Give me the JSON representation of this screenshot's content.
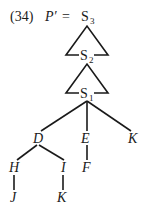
{
  "example": {
    "number": "(34)",
    "lhs": "P′",
    "equals": "="
  },
  "tree": {
    "triangles": [
      {
        "top": {
          "base": "S",
          "sub": "3"
        },
        "bottom": {
          "base": "S",
          "sub": "2"
        }
      },
      {
        "top": {
          "base": "S",
          "sub": "2"
        },
        "bottom": {
          "base": "S",
          "sub": "1"
        }
      }
    ],
    "nodes": {
      "s3": {
        "base": "S",
        "sub": "3"
      },
      "s2": {
        "base": "S",
        "sub": "2"
      },
      "s1": {
        "base": "S",
        "sub": "1"
      },
      "d": "D",
      "e": "E",
      "k1": "K",
      "h": "H",
      "i": "I",
      "f": "F",
      "j": "J",
      "k2": "K"
    },
    "edges": [
      [
        "S1",
        "D"
      ],
      [
        "S1",
        "E"
      ],
      [
        "S1",
        "K"
      ],
      [
        "D",
        "H"
      ],
      [
        "D",
        "I"
      ],
      [
        "E",
        "F"
      ],
      [
        "H",
        "J"
      ],
      [
        "I",
        "K"
      ]
    ]
  }
}
